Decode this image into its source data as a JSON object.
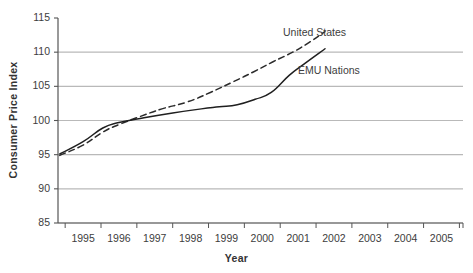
{
  "chart_data": {
    "type": "line",
    "title": "",
    "xlabel": "Year",
    "ylabel": "Consumer Price Index",
    "xlim": [
      1994.3,
      2005.6
    ],
    "ylim": [
      85,
      115
    ],
    "yticks": [
      85,
      90,
      95,
      100,
      105,
      110,
      115
    ],
    "ytick_labels": [
      "85",
      "90",
      "95",
      "100",
      "105",
      "110",
      "115"
    ],
    "xticks": [
      1995,
      1996,
      1997,
      1998,
      1999,
      2000,
      2001,
      2002,
      2003,
      2004,
      2005
    ],
    "xtick_labels": [
      "1995",
      "1996",
      "1997",
      "1998",
      "1999",
      "2000",
      "2001",
      "2002",
      "2003",
      "2004",
      "2005"
    ],
    "grid": "horizontal",
    "grid_color": "#b9b9b9",
    "axis_color": "#555555",
    "legend_position": "inline-annotations",
    "series": [
      {
        "name": "United States",
        "style": "dashed",
        "color": "#2b2b2b",
        "x": [
          1994.35,
          1995.0,
          1995.55,
          1996.0,
          1996.6,
          1997.2,
          1997.9,
          1998.55,
          1999.2,
          1999.75,
          2000.3,
          2000.85,
          2001.3,
          2001.75
        ],
        "values": [
          94.9,
          96.4,
          98.3,
          99.4,
          100.6,
          101.7,
          102.7,
          104.1,
          105.7,
          107.1,
          108.6,
          110.0,
          111.4,
          113.0
        ],
        "label": "United States",
        "label_x": 283,
        "label_y": 26
      },
      {
        "name": "EMU Nations",
        "style": "solid",
        "color": "#1f1f1f",
        "x": [
          1994.35,
          1995.0,
          1995.55,
          1996.0,
          1996.7,
          1997.5,
          1998.3,
          1998.8,
          1999.3,
          1999.8,
          2000.25,
          2000.75,
          2001.2,
          2001.75
        ],
        "values": [
          95.1,
          96.9,
          98.9,
          99.7,
          100.4,
          101.1,
          101.7,
          102.0,
          102.3,
          103.1,
          104.1,
          106.6,
          108.4,
          110.5
        ],
        "label": "EMU Nations",
        "label_x": 298,
        "label_y": 64
      }
    ]
  },
  "plot_geometry": {
    "left": 58,
    "right": 463,
    "top": 18,
    "bottom": 223
  }
}
